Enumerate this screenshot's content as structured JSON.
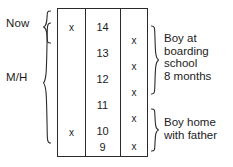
{
  "diagram": {
    "type": "age-timeline-table",
    "left_labels": [
      {
        "id": "now",
        "text": "Now"
      },
      {
        "id": "mh",
        "text": "M/H"
      }
    ],
    "table": {
      "columns": [
        {
          "id": "left-marks",
          "header": ""
        },
        {
          "id": "ages",
          "header": ""
        },
        {
          "id": "right-marks",
          "header": ""
        }
      ],
      "ages": [
        "14",
        "13",
        "12",
        "11",
        "10",
        "9"
      ],
      "left_marks": [
        {
          "age": "14",
          "mark": "x"
        },
        {
          "age": "10",
          "mark": "x"
        }
      ],
      "right_marks": [
        {
          "between": "14-13",
          "mark": "x"
        },
        {
          "between": "13-12",
          "mark": "x"
        },
        {
          "between": "12-11",
          "mark": "x"
        },
        {
          "between": "11-10",
          "mark": "x"
        },
        {
          "between": "10-9",
          "mark": "x"
        }
      ]
    },
    "annotations": [
      {
        "id": "boarding",
        "lines": [
          "Boy at",
          "boarding",
          "school",
          "8 months"
        ],
        "text": "Boy at\nboarding\nschool\n8 months"
      },
      {
        "id": "home",
        "lines": [
          "Boy home",
          "with father"
        ],
        "text": "Boy home\nwith father"
      }
    ],
    "colors": {
      "ink": "#1c1c1c",
      "rule": "#2b2b2b",
      "background": "#ffffff"
    }
  },
  "cells": {
    "age_14": "14",
    "age_13": "13",
    "age_12": "12",
    "age_11": "11",
    "age_10": "10",
    "age_9": "9",
    "left_mark_top": "x",
    "left_mark_bottom": "x",
    "right_mark_1": "x",
    "right_mark_2": "x",
    "right_mark_3": "x",
    "right_mark_4": "x",
    "right_mark_5": "x"
  },
  "annotation_text": {
    "boarding_line_1": "Boy at",
    "boarding_line_2": "boarding",
    "boarding_line_3": "school",
    "boarding_line_4": "8 months",
    "home_line_1": "Boy home",
    "home_line_2": "with father"
  },
  "labels": {
    "now": "Now",
    "mh": "M/H"
  }
}
